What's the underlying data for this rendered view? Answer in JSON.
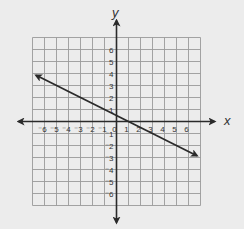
{
  "chart_data": {
    "type": "line",
    "title": "",
    "xlabel": "x",
    "ylabel": "y",
    "xlim": [
      -7,
      7
    ],
    "ylim": [
      -7,
      7
    ],
    "grid": true,
    "x_ticks": [
      -6,
      -5,
      -4,
      -3,
      -2,
      -1,
      0,
      1,
      2,
      3,
      4,
      5,
      6
    ],
    "y_ticks": [
      -6,
      -5,
      -4,
      -3,
      -2,
      -1,
      1,
      2,
      3,
      4,
      5,
      6
    ],
    "x_tick_labels": [
      "⁻6",
      "⁻5",
      "⁻4",
      "⁻3",
      "⁻2",
      "⁻1",
      "0",
      "1",
      "2",
      "3",
      "4",
      "5",
      "6"
    ],
    "y_tick_labels": [
      "⁻6",
      "⁻5",
      "⁻4",
      "⁻3",
      "⁻2",
      "⁻1",
      "1",
      "2",
      "3",
      "4",
      "5",
      "6"
    ],
    "series": [
      {
        "name": "line",
        "equation": "y = -0.5x + 0.5",
        "x": [
          -6.7,
          6.7
        ],
        "y": [
          3.85,
          -2.85
        ],
        "arrows": "both"
      }
    ],
    "legend": null
  },
  "colors": {
    "background": "#ececec",
    "grid": "#9a9a9a",
    "axis": "#2a2a2a",
    "line": "#2a2a2a"
  }
}
